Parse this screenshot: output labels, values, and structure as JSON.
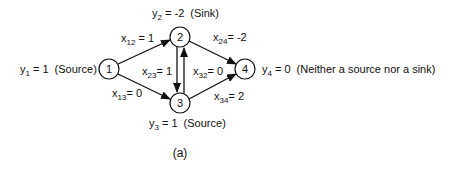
{
  "figure": {
    "caption": "(a)",
    "colors": {
      "stroke": "#111111",
      "background": "#ffffff"
    }
  },
  "nodes": [
    {
      "id": "1",
      "label": "1",
      "supply_var": "y",
      "supply_sub": "1",
      "supply_eq": " = 1",
      "role": "(Source)"
    },
    {
      "id": "2",
      "label": "2",
      "supply_var": "y",
      "supply_sub": "2",
      "supply_eq": " = -2",
      "role": "(Sink)"
    },
    {
      "id": "3",
      "label": "3",
      "supply_var": "y",
      "supply_sub": "3",
      "supply_eq": " = 1",
      "role": "(Source)"
    },
    {
      "id": "4",
      "label": "4",
      "supply_var": "y",
      "supply_sub": "4",
      "supply_eq": " = 0",
      "role": "(Neither a source nor a sink)"
    }
  ],
  "edges": [
    {
      "from": "1",
      "to": "2",
      "var": "x",
      "sub": "12",
      "eq": " = 1"
    },
    {
      "from": "1",
      "to": "3",
      "var": "x",
      "sub": "13",
      "eq": "= 0"
    },
    {
      "from": "2",
      "to": "3",
      "var": "x",
      "sub": "23",
      "eq": "= 1"
    },
    {
      "from": "3",
      "to": "2",
      "var": "x",
      "sub": "32",
      "eq": "= 0"
    },
    {
      "from": "2",
      "to": "4",
      "var": "x",
      "sub": "24",
      "eq": "= -2"
    },
    {
      "from": "3",
      "to": "4",
      "var": "x",
      "sub": "34",
      "eq": "= 2"
    }
  ]
}
